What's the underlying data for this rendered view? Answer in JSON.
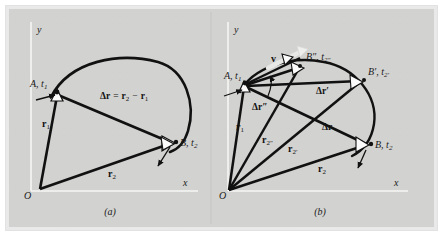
{
  "figure": {
    "background_color": "#d2d2d0",
    "border_color": "#e9e9e9",
    "curve_color": "#111111",
    "vector_color": "#111111",
    "axis_color": "#f4f4f2",
    "arrowhead_fill": "#fafafa",
    "highlight_arrow_color": "#e6e6e4",
    "divider_color": "#c0c0be"
  },
  "panels": [
    {
      "id": "a",
      "caption": "(a)",
      "axes": {
        "x_label": "x",
        "y_label": "y"
      },
      "origin_label": "O",
      "points": [
        {
          "name": "A",
          "label": "A, t",
          "label_full": "A, t₁",
          "base": "A, t",
          "sub": "1"
        },
        {
          "name": "B",
          "label_full": "B, t₂",
          "base": "B, t",
          "sub": "2"
        }
      ],
      "vectors": [
        {
          "name": "r1",
          "base": "r",
          "sub": "1",
          "label_full": "r₁"
        },
        {
          "name": "r2",
          "base": "r",
          "sub": "2",
          "label_full": "r₂"
        },
        {
          "name": "delta_r_equation",
          "label_full": "Δr = r₂ − r₁"
        }
      ]
    },
    {
      "id": "b",
      "caption": "(b)",
      "axes": {
        "x_label": "x",
        "y_label": "y"
      },
      "origin_label": "O",
      "points": [
        {
          "name": "A",
          "label_full": "A, t₁",
          "base": "A, t",
          "sub": "1"
        },
        {
          "name": "B",
          "label_full": "B, t₂",
          "base": "B, t",
          "sub": "2"
        },
        {
          "name": "Bp",
          "label_full": "B′, t₂′",
          "base": "B′, t",
          "sub": "2′"
        },
        {
          "name": "Bpp",
          "label_full": "B″, t₂″",
          "base": "B″, t",
          "sub": "2″"
        }
      ],
      "vectors": [
        {
          "name": "v",
          "label_full": "v"
        },
        {
          "name": "r1",
          "base": "r",
          "sub": "1",
          "label_full": "r₁"
        },
        {
          "name": "r2",
          "base": "r",
          "sub": "2",
          "label_full": "r₂"
        },
        {
          "name": "r2p",
          "base": "r",
          "sub": "2′",
          "label_full": "r₂′"
        },
        {
          "name": "r2pp",
          "base": "r",
          "sub": "2″",
          "label_full": "r₂″"
        },
        {
          "name": "delta_r",
          "label_full": "Δr"
        },
        {
          "name": "delta_rp",
          "label_full": "Δr′"
        },
        {
          "name": "delta_rpp",
          "label_full": "Δr″"
        }
      ]
    }
  ],
  "labels": {
    "a_caption": "(a)",
    "b_caption": "(b)",
    "x": "x",
    "y": "y",
    "O": "O",
    "A_base": "A, t",
    "A_sub": "1",
    "B_base": "B, t",
    "B_sub": "2",
    "Bp_base": "B′, t",
    "Bp_sub": "2′",
    "Bpp_base": "B″, t",
    "Bpp_sub": "2″",
    "r_base": "r",
    "r1_sub": "1",
    "r2_sub": "2",
    "r2p_sub": "2′",
    "r2pp_sub": "2″",
    "v": "v",
    "delta_r": "Δr",
    "delta_rp": "Δr′",
    "delta_rpp": "Δr″",
    "eq_dr": "Δr",
    "eq_eq": "=",
    "eq_r2": "r",
    "eq_r2_sub": "2",
    "eq_minus": "−",
    "eq_r1": "r",
    "eq_r1_sub": "1"
  }
}
